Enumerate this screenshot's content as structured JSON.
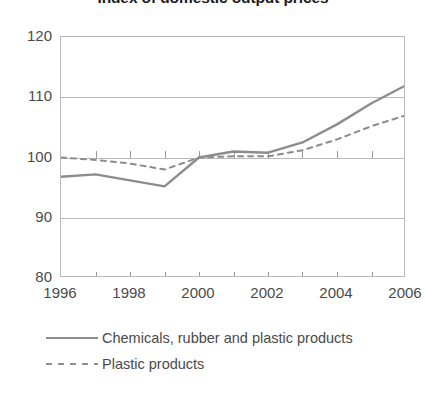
{
  "chart_data": {
    "type": "line",
    "title": "Index of domestic output prices",
    "xlabel": "",
    "ylabel": "",
    "xlim": [
      1996,
      2006
    ],
    "ylim": [
      80,
      120
    ],
    "yticks": [
      80,
      90,
      100,
      110,
      120
    ],
    "xticks": [
      1996,
      1998,
      2000,
      2002,
      2004,
      2006
    ],
    "xtick_labels": [
      "1996",
      "1998",
      "2000",
      "2002",
      "2004",
      "2006"
    ],
    "ytick_labels": [
      "80",
      "90",
      "100",
      "110",
      "120"
    ],
    "minor_xticks": [
      1997,
      1999,
      2001,
      2003,
      2005
    ],
    "grid": "horizontal",
    "legend_position": "bottom-left",
    "x": [
      1996,
      1997,
      1998,
      1999,
      2000,
      2001,
      2002,
      2003,
      2004,
      2005,
      2006
    ],
    "series": [
      {
        "name": "Chemicals, rubber and plastic products",
        "style": "solid",
        "color": "#8c8c8c",
        "values": [
          96.8,
          97.2,
          96.2,
          95.2,
          100.0,
          101.0,
          100.8,
          102.5,
          105.5,
          109.0,
          112.0
        ]
      },
      {
        "name": "Plastic products",
        "style": "dashed",
        "color": "#8c8c8c",
        "values": [
          100.0,
          99.6,
          99.0,
          98.0,
          100.0,
          100.2,
          100.2,
          101.2,
          103.0,
          105.2,
          107.0
        ]
      }
    ]
  },
  "legend": {
    "items": [
      {
        "label": "Chemicals, rubber and plastic products",
        "style": "solid"
      },
      {
        "label": "Plastic products",
        "style": "dashed"
      }
    ]
  }
}
